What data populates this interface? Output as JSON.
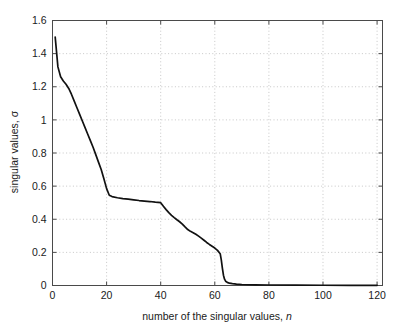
{
  "chart_data": {
    "type": "line",
    "title": "",
    "xlabel": "number of the singular values, n",
    "xlabel_plain": "number of the singular values, ",
    "xlabel_italic": "n",
    "ylabel": "singular values, σ",
    "ylabel_plain": "singular values, ",
    "ylabel_symbol": "σ",
    "xlim": [
      0,
      122
    ],
    "ylim": [
      0,
      1.6
    ],
    "xticks": [
      0,
      20,
      40,
      60,
      80,
      100,
      120
    ],
    "xticklabels": [
      "0",
      "20",
      "40",
      "60",
      "80",
      "100",
      "120"
    ],
    "yticks": [
      0,
      0.2,
      0.4,
      0.6,
      0.8,
      1,
      1.2,
      1.4,
      1.6
    ],
    "yticklabels": [
      "0",
      "0.2",
      "0.4",
      "0.6",
      "0.8",
      "1",
      "1.2",
      "1.4",
      "1.6"
    ],
    "grid": true,
    "grid_style": "dotted",
    "grid_color": "#b9b9b9",
    "legend": null,
    "line_color": "#111111",
    "series": [
      {
        "name": "singular values",
        "x": [
          1,
          2,
          3,
          4,
          5,
          6,
          7,
          8,
          9,
          10,
          11,
          12,
          13,
          14,
          15,
          16,
          17,
          18,
          19,
          20,
          21,
          22,
          24,
          26,
          28,
          30,
          32,
          34,
          36,
          38,
          40,
          41,
          42,
          43,
          44,
          45,
          46,
          47,
          48,
          49,
          50,
          51,
          52,
          53,
          54,
          55,
          56,
          57,
          58,
          59,
          60,
          61,
          62,
          62.4,
          62.8,
          63.2,
          63.6,
          64,
          64.6,
          65.4,
          66.5,
          68,
          70,
          75,
          80,
          90,
          100,
          110,
          120
        ],
        "y": [
          1.5,
          1.32,
          1.26,
          1.235,
          1.215,
          1.19,
          1.155,
          1.115,
          1.075,
          1.035,
          0.995,
          0.955,
          0.915,
          0.875,
          0.835,
          0.79,
          0.745,
          0.7,
          0.645,
          0.585,
          0.545,
          0.537,
          0.53,
          0.525,
          0.521,
          0.517,
          0.513,
          0.51,
          0.507,
          0.503,
          0.5,
          0.478,
          0.458,
          0.44,
          0.424,
          0.41,
          0.397,
          0.385,
          0.371,
          0.354,
          0.338,
          0.327,
          0.319,
          0.309,
          0.298,
          0.286,
          0.273,
          0.26,
          0.248,
          0.237,
          0.226,
          0.212,
          0.192,
          0.155,
          0.105,
          0.062,
          0.038,
          0.026,
          0.019,
          0.014,
          0.011,
          0.008,
          0.006,
          0.004,
          0.003,
          0.002,
          0.0015,
          0.001,
          0.0008
        ]
      }
    ]
  }
}
